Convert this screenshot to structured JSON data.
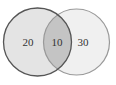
{
  "diagram": {
    "type": "venn",
    "sets": [
      {
        "name": "left-set",
        "value": "20"
      },
      {
        "name": "right-set",
        "value": "30"
      }
    ],
    "intersection": {
      "value": "10"
    },
    "colors": {
      "left_fill": "#e4e4e4",
      "right_fill": "#f0f0f0",
      "intersection_fill": "#c4c4c4",
      "left_stroke": "#555555",
      "right_stroke": "#999999"
    }
  }
}
